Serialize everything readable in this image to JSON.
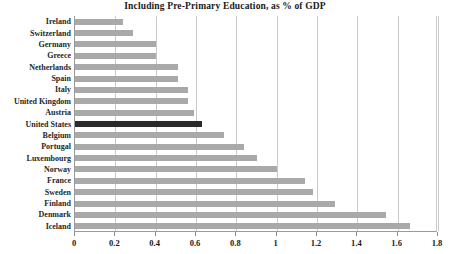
{
  "chart_data": {
    "type": "bar",
    "orientation": "horizontal",
    "title": "Including Pre-Primary Education, as % of GDP",
    "xlabel": "",
    "ylabel": "",
    "xlim": [
      0,
      1.8
    ],
    "xticks": [
      "0",
      "0.2",
      "0.4",
      "0.6",
      "0.8",
      "1",
      "1.2",
      "1.4",
      "1.6",
      "1.8"
    ],
    "xtick_values": [
      0,
      0.2,
      0.4,
      0.6,
      0.8,
      1,
      1.2,
      1.4,
      1.6,
      1.8
    ],
    "grid": "vertical",
    "legend": "none",
    "highlight_category": "United States",
    "colors": {
      "bar": "#a9a9a9",
      "highlight_bar": "#2b2b2b",
      "gridline": "#c9c9c9",
      "axis": "#9a9a9a",
      "text": "#1a1a1a",
      "background": "#ffffff"
    },
    "categories": [
      "Ireland",
      "Switzerland",
      "Germany",
      "Greece",
      "Netherlands",
      "Spain",
      "Italy",
      "United Kingdom",
      "Austria",
      "United States",
      "Belgium",
      "Portugal",
      "Luxembourg",
      "Norway",
      "France",
      "Sweden",
      "Finland",
      "Denmark",
      "Iceland"
    ],
    "values": [
      0.24,
      0.29,
      0.4,
      0.4,
      0.51,
      0.51,
      0.56,
      0.56,
      0.59,
      0.63,
      0.74,
      0.84,
      0.9,
      1.0,
      1.14,
      1.18,
      1.29,
      1.54,
      1.66
    ]
  }
}
